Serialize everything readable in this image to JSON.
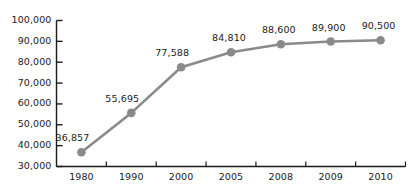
{
  "chart_data": {
    "type": "line",
    "title": "",
    "subtitle": "",
    "xlabel": "",
    "ylabel": "",
    "categories": [
      "1980",
      "1990",
      "2000",
      "2005",
      "2008",
      "2009",
      "2010"
    ],
    "values": [
      36857,
      55695,
      77588,
      84810,
      88600,
      89900,
      90500
    ],
    "point_labels": [
      "36,857",
      "55,695",
      "77,588",
      "84,810",
      "88,600",
      "89,900",
      "90,500"
    ],
    "ylim": [
      30000,
      100000
    ],
    "y_ticks": [
      30000,
      40000,
      50000,
      60000,
      70000,
      80000,
      90000,
      100000
    ],
    "y_tick_labels": [
      "30,000",
      "40,000",
      "50,000",
      "60,000",
      "70,000",
      "80,000",
      "90,000",
      "100,000"
    ],
    "grid": false,
    "legend": null,
    "legend_position": "none",
    "series": [
      {
        "name": "",
        "values": [
          36857,
          55695,
          77588,
          84810,
          88600,
          89900,
          90500
        ]
      }
    ],
    "colors": {
      "line": "#8a8a8a",
      "marker": "#8a8a8a",
      "axis": "#1a1a1a",
      "text": "#1a1a1a",
      "background": "#ffffff"
    },
    "marker_shape": "circle"
  },
  "footer": {
    "faint_text": ""
  }
}
